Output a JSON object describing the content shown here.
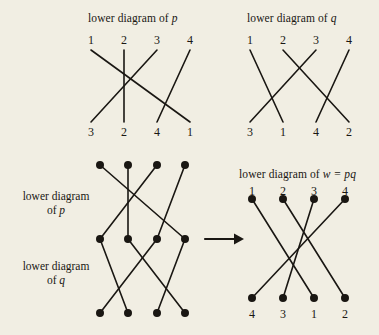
{
  "figure": {
    "background_color": "#f1eee3",
    "ink_color": "#1a1713",
    "titles": {
      "top_left": {
        "prefix": "lower diagram of ",
        "symbol": "p"
      },
      "top_right": {
        "prefix": "lower diagram of ",
        "symbol": "q"
      },
      "result": {
        "prefix": "lower diagram of ",
        "symbol": "w = pq"
      }
    },
    "side_captions": {
      "upper": {
        "line1": "lower diagram",
        "line2_prefix": "of ",
        "line2_symbol": "p"
      },
      "lower": {
        "line1": "lower diagram",
        "line2_prefix": "of ",
        "line2_symbol": "q"
      }
    },
    "arrow": {
      "name": "right-arrow",
      "label": "→"
    },
    "diagrams": {
      "p": {
        "top_labels": [
          "1",
          "2",
          "3",
          "4"
        ],
        "bottom_labels": [
          "3",
          "2",
          "4",
          "1"
        ],
        "wiring_top_to_bottom_position": [
          4,
          2,
          1,
          3
        ],
        "has_endpoint_dots": false
      },
      "q": {
        "top_labels": [
          "1",
          "2",
          "3",
          "4"
        ],
        "bottom_labels": [
          "3",
          "1",
          "4",
          "2"
        ],
        "wiring_top_to_bottom_position": [
          2,
          4,
          1,
          3
        ],
        "has_endpoint_dots": false
      },
      "stacked": {
        "top_row_labels": [],
        "middle_row_labels": [],
        "bottom_row_labels": [],
        "upper_wiring_top_to_middle_position": [
          4,
          2,
          1,
          3
        ],
        "lower_wiring_middle_to_bottom_position": [
          2,
          4,
          1,
          3
        ],
        "has_endpoint_dots": true
      },
      "w": {
        "top_labels": [
          "1",
          "2",
          "3",
          "4"
        ],
        "bottom_labels": [
          "4",
          "3",
          "1",
          "2"
        ],
        "wiring_top_to_bottom_position": [
          3,
          4,
          2,
          1
        ],
        "has_endpoint_dots": true
      }
    }
  }
}
